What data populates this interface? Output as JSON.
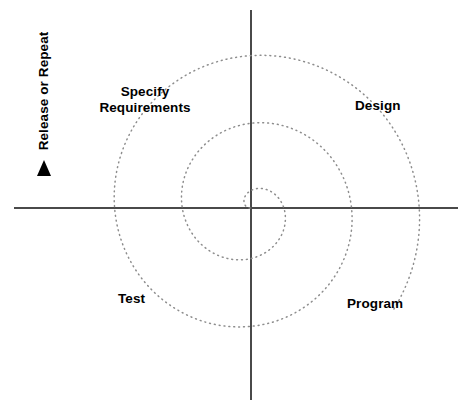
{
  "diagram": {
    "type": "spiral-model",
    "title_visible": false,
    "background_color": "#ffffff",
    "axis_color": "#4a4a4a",
    "spiral_color": "#8d8d8d",
    "text_color": "#000000",
    "center": {
      "x": 250,
      "y": 208
    },
    "axes": {
      "horizontal": {
        "x1": 14,
        "y1": 208,
        "x2": 458,
        "y2": 208
      },
      "vertical": {
        "x1": 251,
        "y1": 10,
        "x2": 251,
        "y2": 400
      }
    },
    "spiral": {
      "style": "dotted",
      "turns": 2.6,
      "direction": "counterclockwise-outward",
      "start_radius": 0,
      "end_radius": 176,
      "arrow": {
        "present": true,
        "shape": "filled-triangle",
        "points_toward": "up",
        "tip": {
          "x": 44,
          "y": 160
        },
        "base_left": {
          "x": 37,
          "y": 176
        },
        "base_right": {
          "x": 51,
          "y": 176
        }
      }
    },
    "labels": {
      "specify_requirements": "Specify Requirements",
      "specify_requirements_line1": "Specify",
      "specify_requirements_line2": "Requirements",
      "design": "Design",
      "program": "Program",
      "test": "Test",
      "release_or_repeat": "Release or Repeat"
    }
  }
}
